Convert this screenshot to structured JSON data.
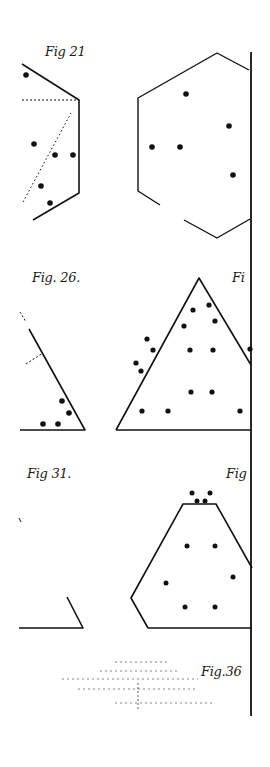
{
  "page": {
    "background": "#ffffff",
    "ink": "#111111",
    "width": 270,
    "height": 767
  },
  "labels": [
    {
      "id": "fig21",
      "text": "Fig 21",
      "x": 45,
      "y": 56
    },
    {
      "id": "fig26",
      "text": "Fig. 26.",
      "x": 32,
      "y": 282
    },
    {
      "id": "fig_partial_top",
      "text": "Fi",
      "x": 232,
      "y": 282
    },
    {
      "id": "fig31",
      "text": "Fig 31.",
      "x": 27,
      "y": 478
    },
    {
      "id": "fig_partial_mid",
      "text": "Fig",
      "x": 226,
      "y": 478
    },
    {
      "id": "fig36",
      "text": "Fig.36",
      "x": 201,
      "y": 676
    }
  ],
  "figures": [
    {
      "name": "fig-21-partial-hexagon",
      "polylines": [
        {
          "points": [
            [
              22,
              64
            ],
            [
              79,
              100
            ],
            [
              79,
              193
            ],
            [
              33,
              220
            ]
          ],
          "width": 1.6
        },
        {
          "points": [
            [
              22,
              100
            ],
            [
              79,
              100
            ]
          ],
          "width": 1,
          "dash": "2,2"
        },
        {
          "points": [
            [
              23,
              202
            ],
            [
              71,
              113
            ]
          ],
          "width": 1,
          "dash": "1.5,2.5"
        }
      ],
      "dots": [
        [
          26,
          75
        ],
        [
          34,
          144
        ],
        [
          55,
          155
        ],
        [
          73,
          155
        ],
        [
          41,
          186
        ],
        [
          50,
          203
        ]
      ],
      "dot_radius": 2.8
    },
    {
      "name": "fig-21-right-hexagon",
      "polylines": [
        {
          "points": [
            [
              160,
              205
            ],
            [
              138,
              191
            ],
            [
              138,
              98
            ],
            [
              217,
              53
            ],
            [
              249,
              70
            ]
          ],
          "width": 1.4
        },
        {
          "points": [
            [
              184,
              220
            ],
            [
              217,
              238
            ],
            [
              250,
              219
            ]
          ],
          "width": 1.4
        }
      ],
      "dots": [
        [
          186,
          94
        ],
        [
          152,
          147
        ],
        [
          180,
          147
        ],
        [
          233,
          175
        ],
        [
          229,
          126
        ]
      ],
      "dot_radius": 2.8
    },
    {
      "name": "fig-26-partial-triangle",
      "polylines": [
        {
          "points": [
            [
              29,
              329
            ],
            [
              85,
              430
            ],
            [
              20,
              430
            ]
          ],
          "width": 1.6
        },
        {
          "points": [
            [
              26,
              364
            ],
            [
              43,
              353
            ]
          ],
          "width": 1,
          "dash": "2,2"
        },
        {
          "points": [
            [
              20,
              312
            ],
            [
              26,
              322
            ]
          ],
          "width": 1,
          "dash": "2,2"
        }
      ],
      "dots": [
        [
          62,
          401
        ],
        [
          69,
          413
        ],
        [
          43,
          424
        ],
        [
          58,
          424
        ]
      ],
      "dot_radius": 2.8
    },
    {
      "name": "fig-26-right-triangle",
      "polylines": [
        {
          "points": [
            [
              116,
              430
            ],
            [
              199,
              278
            ],
            [
              251,
              365
            ]
          ],
          "width": 1.6
        },
        {
          "points": [
            [
              116,
              430
            ],
            [
              251,
              430
            ]
          ],
          "width": 1.6
        }
      ],
      "dots": [
        [
          209,
          305
        ],
        [
          193,
          310
        ],
        [
          215,
          321
        ],
        [
          184,
          326
        ],
        [
          147,
          339
        ],
        [
          153,
          350
        ],
        [
          190,
          350
        ],
        [
          213,
          350
        ],
        [
          136,
          363
        ],
        [
          141,
          371
        ],
        [
          191,
          392
        ],
        [
          212,
          392
        ],
        [
          142,
          411
        ],
        [
          168,
          411
        ],
        [
          240,
          411
        ],
        [
          250,
          349
        ]
      ],
      "dot_radius": 2.6
    },
    {
      "name": "fig-31-partial-corner",
      "polylines": [
        {
          "points": [
            [
              67,
              597
            ],
            [
              83,
              628
            ],
            [
              19,
              628
            ]
          ],
          "width": 1.6
        },
        {
          "points": [
            [
              19,
              518
            ],
            [
              21,
              522
            ]
          ],
          "width": 1
        }
      ],
      "dots": [],
      "dot_radius": 2.6
    },
    {
      "name": "fig-31-right-trapezoid",
      "polylines": [
        {
          "points": [
            [
              148,
              628
            ],
            [
              131,
              598
            ],
            [
              183,
              504
            ],
            [
              216,
              504
            ],
            [
              252,
              568
            ]
          ],
          "width": 1.6
        },
        {
          "points": [
            [
              148,
              628
            ],
            [
              252,
              628
            ]
          ],
          "width": 1.6
        }
      ],
      "dots": [
        [
          192,
          493
        ],
        [
          210,
          493
        ],
        [
          197,
          501
        ],
        [
          205,
          501
        ],
        [
          187,
          546
        ],
        [
          215,
          546
        ],
        [
          166,
          583
        ],
        [
          233,
          577
        ],
        [
          185,
          607
        ],
        [
          215,
          607
        ]
      ],
      "dot_radius": 2.5
    }
  ],
  "spine": {
    "x": 251,
    "y1": 52,
    "y2": 716,
    "width": 1.8
  },
  "fig36_pattern": {
    "dashed_rows": [
      {
        "y": 662,
        "x1": 115,
        "x2": 170
      },
      {
        "y": 671,
        "x1": 100,
        "x2": 180
      },
      {
        "y": 679,
        "x1": 62,
        "x2": 198
      },
      {
        "y": 689,
        "x1": 78,
        "x2": 196
      },
      {
        "y": 703,
        "x1": 115,
        "x2": 215
      }
    ],
    "center_tick": {
      "x": 138,
      "y1": 683,
      "y2": 710
    }
  }
}
